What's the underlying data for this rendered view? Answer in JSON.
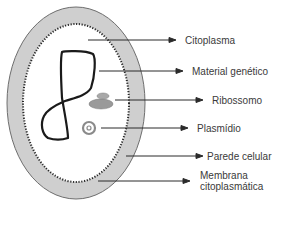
{
  "diagram": {
    "title": "",
    "colors": {
      "wall_fill": "#cfcfcf",
      "wall_stroke": "#6e6e6e",
      "cytoplasm_fill": "#ffffff",
      "membrane_dots": "#2a2a2a",
      "dna": "#1a1a1a",
      "ribosome": "#9a9a9a",
      "plasmid": "#8a8a8a",
      "arrow": "#2a2a2a",
      "text": "#3a3a3a"
    },
    "labels": [
      {
        "text": "Citoplasma"
      },
      {
        "text": "Material genético"
      },
      {
        "text": "Ribossomo"
      },
      {
        "text": "Plasmídio"
      },
      {
        "text": "Parede celular"
      },
      {
        "text": "Membrana"
      },
      {
        "text": "citoplasmática"
      }
    ]
  }
}
